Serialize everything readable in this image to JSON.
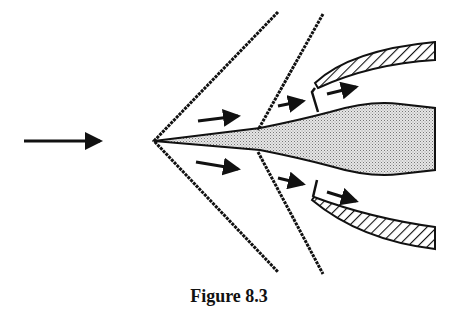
{
  "figure": {
    "caption": "Figure 8.3",
    "colors": {
      "ink": "#111111",
      "centerbody_fill": "#c8c8c8",
      "background": "#ffffff"
    }
  }
}
